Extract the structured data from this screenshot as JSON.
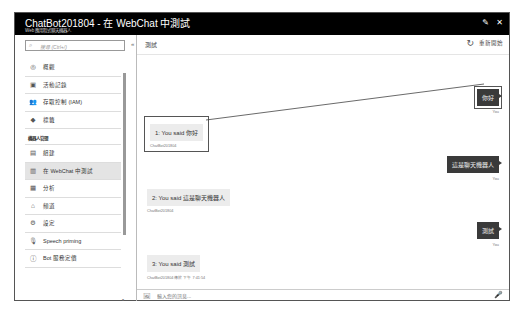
{
  "window": {
    "title": "ChatBot201804 - 在 WebChat 中測試",
    "subtitle": "Web 應用程式聊天機器人",
    "pin_icon": "pin-icon",
    "close_icon": "close-icon",
    "pin_glyph": "✎",
    "close_glyph": "✕"
  },
  "sidebar": {
    "search_placeholder": "搜尋 (Ctrl+/)",
    "search_glyph": "⌕",
    "collapse_glyph": "«",
    "items_top": [
      {
        "label": "概觀",
        "icon": "overview-icon",
        "glyph": "◎"
      },
      {
        "label": "活動記錄",
        "icon": "activity-log-icon",
        "glyph": "▣"
      },
      {
        "label": "存取控制 (IAM)",
        "icon": "people-icon",
        "glyph": "👥"
      },
      {
        "label": "標籤",
        "icon": "tag-icon",
        "glyph": "◆"
      }
    ],
    "section_title": "機器人管理",
    "items_bottom": [
      {
        "label": "組建",
        "icon": "build-icon",
        "glyph": "▤",
        "active": false
      },
      {
        "label": "在 WebChat 中測試",
        "icon": "webchat-icon",
        "glyph": "▥",
        "active": true
      },
      {
        "label": "分析",
        "icon": "analytics-icon",
        "glyph": "▦",
        "active": false
      },
      {
        "label": "頻道",
        "icon": "channels-icon",
        "glyph": "⌂",
        "active": false
      },
      {
        "label": "設定",
        "icon": "settings-icon",
        "glyph": "⚙",
        "active": false
      },
      {
        "label": "Speech priming",
        "icon": "microphone-icon",
        "glyph": "🎙",
        "active": false
      },
      {
        "label": "Bot 服務定價",
        "icon": "pricing-icon",
        "glyph": "ⓘ",
        "active": false
      }
    ]
  },
  "main": {
    "title": "測試",
    "restart_label": "重新開始",
    "restart_glyph": "↻",
    "messages": [
      {
        "from": "user",
        "text": "你好",
        "meta": "You"
      },
      {
        "from": "bot",
        "text": "1: You said 你好",
        "meta": "ChatBot201804"
      },
      {
        "from": "user",
        "text": "這是聊天機器人",
        "meta": "You"
      },
      {
        "from": "bot",
        "text": "2: You said 這是聊天機器人",
        "meta": "ChatBot201804"
      },
      {
        "from": "user",
        "text": "測試",
        "meta": "You"
      },
      {
        "from": "bot",
        "text": "3: You said 測試",
        "meta": "ChatBot201804 傳於 下午 7:41:54"
      }
    ],
    "composer": {
      "placeholder": "輸入您的訊息...",
      "image_glyph": "🖼",
      "mic_glyph": "🎤"
    }
  },
  "colors": {
    "titlebar": "#000000",
    "user_bubble": "#3a3a3a",
    "bot_bubble": "#ececec",
    "active_item": "#e4e4e4"
  }
}
